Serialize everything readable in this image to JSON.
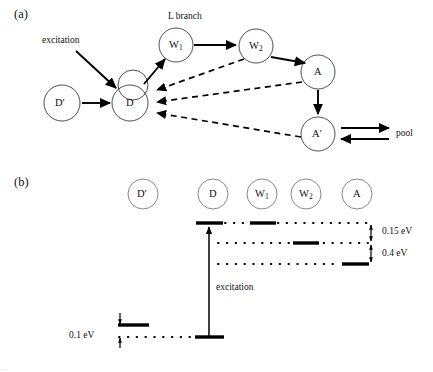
{
  "figure": {
    "panel_a": {
      "tag": "(a)",
      "annotations": {
        "excitation": "excitation",
        "l_branch": "L branch",
        "pool": "pool"
      },
      "nodes": [
        {
          "id": "Dprime",
          "label": "D",
          "prime": true,
          "sub": "",
          "cx": 62,
          "cy": 103,
          "r": 18
        },
        {
          "id": "D_upper",
          "label": "",
          "prime": false,
          "sub": "",
          "cx": 133,
          "cy": 85,
          "r": 15
        },
        {
          "id": "D",
          "label": "D",
          "prime": false,
          "sub": "",
          "cx": 130,
          "cy": 103,
          "r": 18
        },
        {
          "id": "W1",
          "label": "W",
          "prime": false,
          "sub": "1",
          "cx": 176,
          "cy": 45,
          "r": 17
        },
        {
          "id": "W2",
          "label": "W",
          "prime": false,
          "sub": "2",
          "cx": 256,
          "cy": 46,
          "r": 17
        },
        {
          "id": "A",
          "label": "A",
          "prime": false,
          "sub": "",
          "cx": 318,
          "cy": 72,
          "r": 17
        },
        {
          "id": "Aprime",
          "label": "A",
          "prime": true,
          "sub": "",
          "cx": 318,
          "cy": 134,
          "r": 17
        }
      ],
      "edges": [
        {
          "from": "excitation-source",
          "to": "D",
          "style": "solid"
        },
        {
          "from": "Dprime",
          "to": "D",
          "style": "solid"
        },
        {
          "from": "D",
          "to": "W1",
          "style": "solid"
        },
        {
          "from": "W1",
          "to": "W2",
          "style": "solid"
        },
        {
          "from": "W2",
          "to": "A",
          "style": "solid"
        },
        {
          "from": "A",
          "to": "Aprime",
          "style": "solid"
        },
        {
          "from": "W2",
          "to": "D",
          "style": "dashed"
        },
        {
          "from": "A",
          "to": "D",
          "style": "dashed"
        },
        {
          "from": "Aprime",
          "to": "D",
          "style": "dashed"
        },
        {
          "from": "Aprime",
          "to": "pool",
          "style": "solid"
        },
        {
          "from": "pool",
          "to": "Aprime",
          "style": "solid"
        }
      ]
    },
    "panel_b": {
      "tag": "(b)",
      "annotations": {
        "excitation": "excitation"
      },
      "columns": [
        {
          "id": "Dprime",
          "label": "D",
          "prime": true,
          "sub": "",
          "cx": 143,
          "cy": 194,
          "r": 15
        },
        {
          "id": "D",
          "label": "D",
          "prime": false,
          "sub": "",
          "cx": 213,
          "cy": 194,
          "r": 15
        },
        {
          "id": "W1",
          "label": "W",
          "prime": false,
          "sub": "1",
          "cx": 262,
          "cy": 194,
          "r": 15
        },
        {
          "id": "W2",
          "label": "W",
          "prime": false,
          "sub": "2",
          "cx": 306,
          "cy": 194,
          "r": 15
        },
        {
          "id": "A",
          "label": "A",
          "prime": false,
          "sub": "",
          "cx": 357,
          "cy": 194,
          "r": 15
        }
      ],
      "levels": [
        {
          "id": "level-D-excited",
          "column": "D",
          "y": 223,
          "x1": 196,
          "x2": 223,
          "dotted_to": 368
        },
        {
          "id": "level-W1",
          "column": "W1",
          "y": 223,
          "x1": 250,
          "x2": 276,
          "dotted_to": 368
        },
        {
          "id": "level-W2",
          "column": "W2",
          "y": 243,
          "x1": 293,
          "x2": 319,
          "dotted_to": 368
        },
        {
          "id": "level-A",
          "column": "A",
          "y": 264,
          "x1": 342,
          "x2": 369,
          "dotted_to": 369
        },
        {
          "id": "level-Dprime",
          "column": "Dprime",
          "y": 325,
          "x1": 118,
          "x2": 149,
          "dotted_to": 0
        },
        {
          "id": "level-D-ground",
          "column": "D",
          "y": 337,
          "x1": 195,
          "x2": 224,
          "dotted_to": 0
        }
      ],
      "dotted_rows": [
        {
          "id": "dotted-top",
          "y": 223,
          "x1": 223,
          "x2": 368
        },
        {
          "id": "dotted-mid",
          "y": 243,
          "x1": 217,
          "x2": 368
        },
        {
          "id": "dotted-low",
          "y": 264,
          "x1": 217,
          "x2": 343
        },
        {
          "id": "dotted-ground",
          "y": 337,
          "x1": 118,
          "x2": 196
        }
      ],
      "energy_gaps": [
        {
          "id": "gap-015",
          "label": "0.15 eV",
          "y_top": 223,
          "y_bottom": 243,
          "x": 371,
          "label_x": 382,
          "label_y": 228
        },
        {
          "id": "gap-04",
          "label": "0.4 eV",
          "y_top": 243,
          "y_bottom": 264,
          "x": 371,
          "label_x": 382,
          "label_y": 249
        },
        {
          "id": "gap-01",
          "label": "0.1 eV",
          "y_top": 325,
          "y_bottom": 337,
          "x": 120,
          "label_x": 70,
          "label_y": 326
        }
      ],
      "excitation_arrow": {
        "x": 209,
        "y_from": 337,
        "y_to": 225
      }
    },
    "caption_partial": "...."
  }
}
